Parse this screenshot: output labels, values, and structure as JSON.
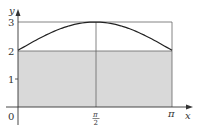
{
  "chart_data": {
    "type": "area",
    "title": "",
    "xlabel": "x",
    "ylabel": "y",
    "function": "y = 2 + sin(x)",
    "xlim": [
      0,
      3.14159
    ],
    "ylim": [
      0,
      3
    ],
    "x_ticks": [
      {
        "value": 0,
        "label": "0"
      },
      {
        "value": 1.5708,
        "label_num": "π",
        "label_den": "2"
      },
      {
        "value": 3.14159,
        "label": "π"
      }
    ],
    "y_ticks": [
      {
        "value": 1,
        "label": "1"
      },
      {
        "value": 2,
        "label": "2"
      },
      {
        "value": 3,
        "label": "3"
      }
    ],
    "curve": {
      "x": [
        0,
        0.3927,
        0.7854,
        1.1781,
        1.5708,
        1.9635,
        2.3562,
        2.7489,
        3.14159
      ],
      "y": [
        2.0,
        2.383,
        2.707,
        2.924,
        3.0,
        2.924,
        2.707,
        2.383,
        2.0
      ]
    },
    "shaded_rectangle": {
      "x": [
        0,
        3.14159
      ],
      "y": [
        0,
        2
      ],
      "color": "#d9d9d9"
    },
    "bounding_rectangle": {
      "x": [
        0,
        3.14159
      ],
      "y": [
        0,
        3
      ]
    },
    "vertical_line_at": 1.5708,
    "grid": false,
    "colors": {
      "axis": "#333333",
      "curve": "#222222",
      "shade": "#d9d9d9",
      "guide": "#666666"
    }
  }
}
